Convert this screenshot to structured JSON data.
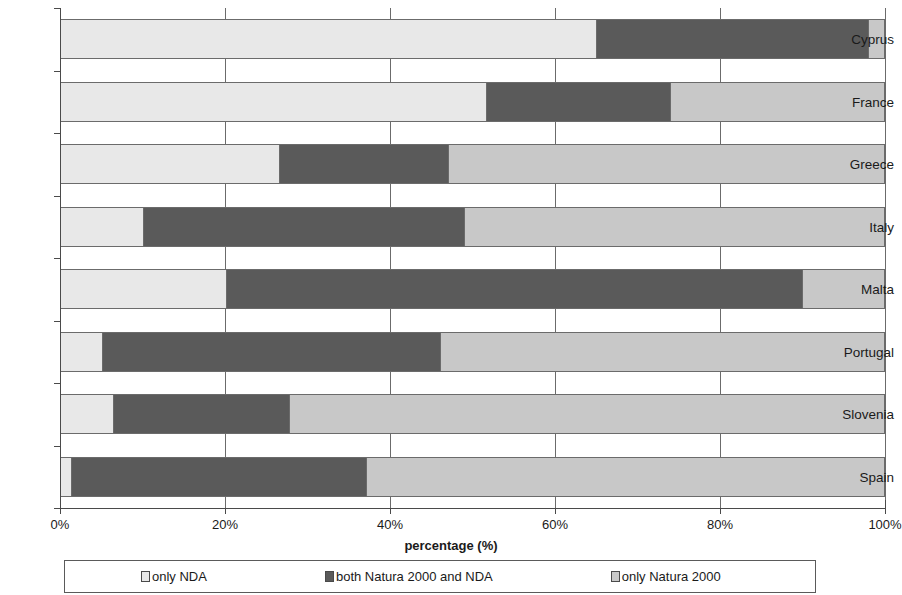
{
  "chart_data": {
    "type": "bar",
    "orientation": "horizontal",
    "stacked": true,
    "stack_mode": "percent",
    "title": "",
    "xlabel": "percentage (%)",
    "ylabel": "",
    "xlim": [
      0,
      100
    ],
    "xticks": [
      0,
      20,
      40,
      60,
      80,
      100
    ],
    "xtick_labels": [
      "0%",
      "20%",
      "40%",
      "60%",
      "80%",
      "100%"
    ],
    "grid": true,
    "grid_axis": "x",
    "legend_position": "bottom",
    "categories": [
      "Cyprus",
      "France",
      "Greece",
      "Italy",
      "Malta",
      "Portugal",
      "Slovenia",
      "Spain"
    ],
    "series": [
      {
        "name": "only NDA",
        "color": "#e8e8e8",
        "values": [
          65.0,
          51.7,
          26.5,
          10.0,
          20.0,
          5.0,
          6.3,
          1.2
        ]
      },
      {
        "name": "both Natura 2000 and NDA",
        "color": "#5a5a5a",
        "values": [
          33.0,
          22.3,
          20.5,
          39.0,
          70.0,
          41.0,
          21.4,
          35.8
        ]
      },
      {
        "name": "only Natura 2000",
        "color": "#c8c8c8",
        "values": [
          2.0,
          26.0,
          53.0,
          51.0,
          10.0,
          54.0,
          72.3,
          63.0
        ]
      }
    ]
  },
  "colors": {
    "only_nda": "#e8e8e8",
    "both": "#5a5a5a",
    "only_natura": "#c8c8c8",
    "axis": "#4a4a4a",
    "gridline": "#6b6b6b",
    "bar_border": "#6b6b6b",
    "text": "#1a1a1a",
    "background": "#ffffff"
  }
}
